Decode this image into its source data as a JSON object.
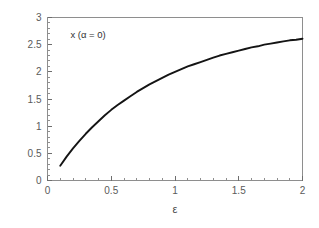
{
  "chart_data": {
    "type": "line",
    "title": "",
    "subtitle": "",
    "xlabel": "ε",
    "ylabel": "",
    "xlim": [
      0,
      2
    ],
    "ylim": [
      0,
      3
    ],
    "grid": false,
    "legend": null,
    "annotations": [
      {
        "text": "x (α = 0)",
        "x": 0.18,
        "y": 2.62
      }
    ],
    "xticks": [
      0,
      0.5,
      1,
      1.5,
      2
    ],
    "xtick_labels": [
      "0",
      "0.5",
      "1",
      "1.5",
      "2"
    ],
    "xtick_minor_step": 0.1,
    "yticks": [
      0,
      0.5,
      1,
      1.5,
      2,
      2.5,
      3
    ],
    "ytick_labels": [
      "0",
      "0.5",
      "1",
      "1.5",
      "2",
      "2.5",
      "3"
    ],
    "ytick_minor_step": 0.1,
    "series": [
      {
        "name": "x (α = 0)",
        "color": "#141414",
        "x": [
          0.1,
          0.15,
          0.2,
          0.25,
          0.3,
          0.35,
          0.4,
          0.45,
          0.5,
          0.55,
          0.6,
          0.65,
          0.7,
          0.75,
          0.8,
          0.85,
          0.9,
          0.95,
          1.0,
          1.05,
          1.1,
          1.15,
          1.2,
          1.25,
          1.3,
          1.35,
          1.4,
          1.45,
          1.5,
          1.55,
          1.6,
          1.65,
          1.7,
          1.75,
          1.8,
          1.85,
          1.9,
          1.95,
          2.0
        ],
        "y": [
          0.27,
          0.44,
          0.59,
          0.73,
          0.86,
          0.98,
          1.09,
          1.2,
          1.3,
          1.39,
          1.47,
          1.55,
          1.63,
          1.7,
          1.77,
          1.83,
          1.89,
          1.95,
          2.0,
          2.05,
          2.1,
          2.14,
          2.18,
          2.22,
          2.26,
          2.3,
          2.33,
          2.36,
          2.39,
          2.42,
          2.45,
          2.47,
          2.5,
          2.52,
          2.54,
          2.56,
          2.58,
          2.59,
          2.61
        ]
      }
    ]
  },
  "figure": {
    "background_color": "#ffffff",
    "frame_color": "#8e8e8e",
    "tick_label_color": "#5a5a5a",
    "axis_title_color": "#4a4a4a"
  }
}
